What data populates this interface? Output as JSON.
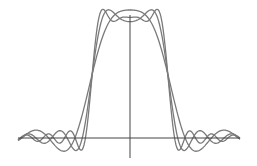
{
  "chart_data": {
    "type": "line",
    "title": "",
    "xlabel": "",
    "ylabel": "",
    "xlim": [
      -2.92,
      2.92
    ],
    "ylim": [
      -0.17,
      1.0
    ],
    "grid": false,
    "legend": null,
    "pulse_half_width": 1.0,
    "series": [
      {
        "name": "cutoff-low",
        "cutoff": 4.4,
        "color": "#7a7a7a"
      },
      {
        "name": "cutoff-mid",
        "cutoff": 7.6,
        "color": "#7a7a7a"
      },
      {
        "name": "cutoff-high",
        "cutoff": 11.0,
        "color": "#7a7a7a"
      }
    ],
    "key_points": [
      {
        "x": -1.0,
        "y": 0.5,
        "note": "all curves cross at half height"
      },
      {
        "x": 1.0,
        "y": 0.5,
        "note": "all curves cross at half height"
      },
      {
        "x": 0.0,
        "y": 0.98,
        "note": "smooth dome peak"
      },
      {
        "x": 0.0,
        "y": 0.8,
        "note": "center dip of mid-cutoff curve"
      },
      {
        "x": -0.75,
        "y": 1.09,
        "note": "Gibbs overshoot"
      },
      {
        "x": -1.2,
        "y": -0.09,
        "note": "Gibbs undershoot"
      }
    ]
  },
  "plot": {
    "origin_px": [
      130,
      138
    ],
    "x_axis_px": [
      18,
      240
    ],
    "y_axis_px": [
      15,
      158
    ],
    "unit_px": 38,
    "amp_px": 120,
    "axis_color": "#444444",
    "background": "#ffffff"
  }
}
